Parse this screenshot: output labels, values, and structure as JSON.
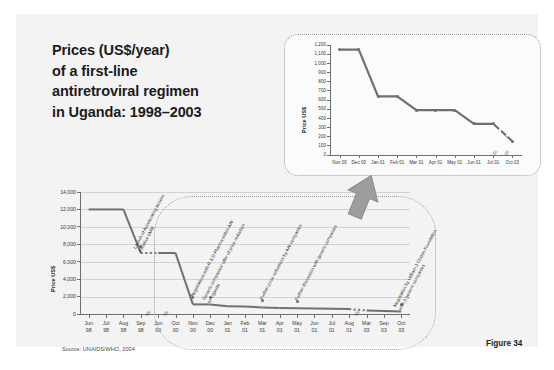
{
  "slide": {
    "title_lines": [
      "Prices (US$/year)",
      "of a first-line",
      "antiretroviral regimen",
      "in Uganda: 1998–2003"
    ],
    "source": "Source: UNAIDS/WHO, 2004",
    "figure_label": "Figure 34",
    "arrow_icon": "up-arrow-icon",
    "colors": {
      "slide_background": "#f3f3f3",
      "page_background": "#ffffff",
      "line": "#707070",
      "grid": "#d2d2d2",
      "axis": "#6f6f6f",
      "text": "#1b1b1b",
      "callout_border": "#9a9a9a"
    }
  },
  "chart_data": [
    {
      "id": "main",
      "type": "line",
      "title": "Prices (US$/year) of a first-line antiretroviral regimen in Uganda: 1998–2003",
      "xlabel": "",
      "ylabel": "Price US$",
      "ylim": [
        0,
        14000
      ],
      "ytick_step": 2000,
      "yticks": [
        "0",
        "2,000",
        "4,000",
        "6,000",
        "8,000",
        "10,000",
        "12,000",
        "14,000"
      ],
      "grid": true,
      "legend": "none",
      "axis_breaks": [
        "between Sep 98 and Jun 00",
        "between Jun 00 and Oct 00",
        "between Aug 01 and Mar 03"
      ],
      "categories": [
        "Jun 98",
        "Jul 98",
        "Aug 98",
        "Sep 98",
        "Jun 00",
        "Oct 00",
        "Nov 00",
        "Dec 00",
        "Jan 01",
        "Feb 01",
        "Mar 01",
        "Apr 01",
        "May 01",
        "Jun 01",
        "Jul 01",
        "Aug 01",
        "Mar 03",
        "Sep 03",
        "Oct 03"
      ],
      "category_lines": [
        [
          "Jun",
          "98"
        ],
        [
          "Jul",
          "98"
        ],
        [
          "Aug",
          "98"
        ],
        [
          "Sep",
          "98"
        ],
        [
          "Jun",
          "00"
        ],
        [
          "Oct",
          "00"
        ],
        [
          "Nov",
          "00"
        ],
        [
          "Dec",
          "00"
        ],
        [
          "Jan",
          "01"
        ],
        [
          "Feb",
          "01"
        ],
        [
          "Mar",
          "01"
        ],
        [
          "Apr",
          "01"
        ],
        [
          "May",
          "01"
        ],
        [
          "Jun",
          "01"
        ],
        [
          "Jul",
          "01"
        ],
        [
          "Aug",
          "01"
        ],
        [
          "Mar",
          "03"
        ],
        [
          "Sep",
          "03"
        ],
        [
          "Oct",
          "03"
        ]
      ],
      "values": [
        12000,
        12000,
        12000,
        7000,
        7000,
        7000,
        1100,
        1100,
        900,
        850,
        760,
        700,
        660,
        620,
        590,
        560,
        400,
        330,
        300
      ],
      "annotations": [
        {
          "label_lines": [
            "Launch of Accelerating Access",
            "Initiative (AAI)"
          ],
          "at": "Sep 98"
        },
        {
          "label_lines": [
            "Negotiations with R & D Pharma within AAI"
          ],
          "at": "Nov 00"
        },
        {
          "label_lines": [
            "Generic companies' offer of price reduction",
            "to Uganda"
          ],
          "at": "Dec 00"
        },
        {
          "label_lines": [
            "Further price reductions by AAI companies"
          ],
          "at": "Mar 01"
        },
        {
          "label_lines": [
            "Further discussion with generic companies"
          ],
          "at": "May 01"
        },
        {
          "label_lines": [
            "Negotiation by William J Clinton Foundation",
            "with 3 generic companies"
          ],
          "at": "Oct 03"
        }
      ]
    },
    {
      "id": "inset",
      "type": "line",
      "title": "",
      "xlabel": "",
      "ylabel": "Price US$",
      "ylim": [
        0,
        1200
      ],
      "ytick_step": 100,
      "yticks": [
        "0",
        "100",
        "200",
        "300",
        "400",
        "500",
        "600",
        "700",
        "800",
        "900",
        "1,000",
        "1,100",
        "1,200"
      ],
      "grid": false,
      "legend": "none",
      "axis_breaks": [
        "between Jul 01 and Oct 03"
      ],
      "categories": [
        "Nov 00",
        "Dec 00",
        "Jan 01",
        "Feb 01",
        "Mar 01",
        "Apr 01",
        "May 01",
        "Jun 01",
        "Jul 01",
        "Oct 03"
      ],
      "values": [
        1150,
        1150,
        640,
        640,
        490,
        490,
        490,
        340,
        340,
        150
      ]
    }
  ]
}
